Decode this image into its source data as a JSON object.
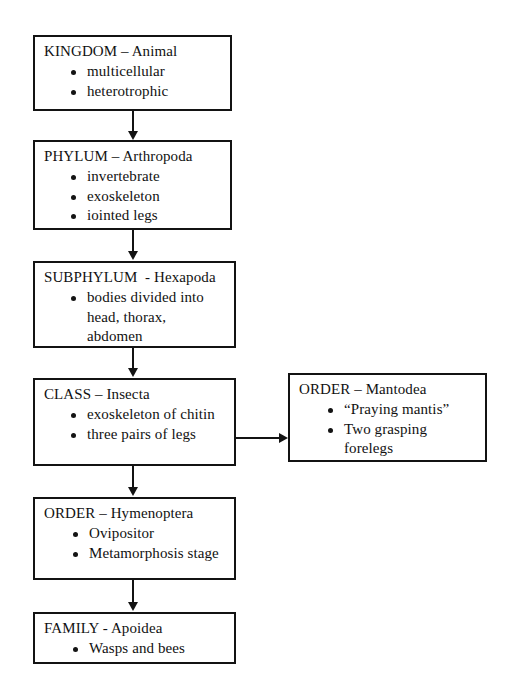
{
  "diagram": {
    "line_color": "#131313",
    "background": "#ffffff",
    "nodes": [
      {
        "id": "kingdom",
        "rank": "KINGDOM",
        "title": "KINGDOM – Animal",
        "bullets": [
          "multicellular",
          "heterotrophic"
        ]
      },
      {
        "id": "phylum",
        "rank": "PHYLUM",
        "title": "PHYLUM – Arthropoda",
        "bullets": [
          "invertebrate",
          "exoskeleton",
          "iointed legs"
        ]
      },
      {
        "id": "subphylum",
        "rank": "SUBPHYLUM",
        "title": "SUBPHYLUM  - Hexapoda",
        "bullets": [
          "bodies divided into head, thorax, abdomen"
        ]
      },
      {
        "id": "class",
        "rank": "CLASS",
        "title": "CLASS – Insecta",
        "bullets": [
          "exoskeleton of chitin",
          "three pairs of legs"
        ]
      },
      {
        "id": "order-mantodea",
        "rank": "ORDER",
        "title": "ORDER – Mantodea",
        "bullets": [
          "“Praying mantis”",
          "Two grasping forelegs"
        ]
      },
      {
        "id": "order-hymenoptera",
        "rank": "ORDER",
        "title": "ORDER – Hymenoptera",
        "bullets": [
          "Ovipositor",
          "Metamorphosis stage"
        ]
      },
      {
        "id": "family",
        "rank": "FAMILY",
        "title": "FAMILY - Apoidea",
        "bullets": [
          "Wasps and bees"
        ]
      }
    ],
    "connectors": [
      {
        "id": "kingdom-to-phylum",
        "from": "kingdom",
        "to": "phylum",
        "direction": "down"
      },
      {
        "id": "phylum-to-subphylum",
        "from": "phylum",
        "to": "subphylum",
        "direction": "down"
      },
      {
        "id": "subphylum-to-class",
        "from": "subphylum",
        "to": "class",
        "direction": "down"
      },
      {
        "id": "class-to-mantodea",
        "from": "class",
        "to": "order-mantodea",
        "direction": "right"
      },
      {
        "id": "class-to-hymenoptera",
        "from": "class",
        "to": "order-hymenoptera",
        "direction": "down"
      },
      {
        "id": "hymenoptera-to-family",
        "from": "order-hymenoptera",
        "to": "family",
        "direction": "down"
      }
    ]
  }
}
